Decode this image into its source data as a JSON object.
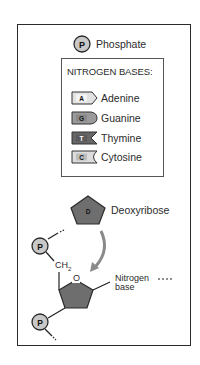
{
  "legend": {
    "phosphate": {
      "symbol": "P",
      "label": "Phosphate"
    },
    "nitrogen_bases_title": "NITROGEN BASES:",
    "bases": [
      {
        "symbol": "A",
        "label": "Adenine",
        "fill": "#e2e2e2"
      },
      {
        "symbol": "G",
        "label": "Guanine",
        "fill": "#9a9a9a"
      },
      {
        "symbol": "T",
        "label": "Thymine",
        "fill": "#666666"
      },
      {
        "symbol": "C",
        "label": "Cytosine",
        "fill": "#dcdcdc"
      }
    ],
    "deoxyribose": {
      "symbol": "D",
      "label": "Deoxyribose"
    }
  },
  "structure": {
    "phosphate_top": "P",
    "phosphate_bottom": "P",
    "ch2_label": "CH",
    "ch2_subscript": "2",
    "oxygen_label": "O",
    "nitrogen_label_line1": "Nitrogen",
    "nitrogen_label_line2": "base"
  },
  "colors": {
    "phosphate_fill": "#c8c8c8",
    "sugar_fill": "#6e6e6e",
    "outline": "#2a2a2a",
    "arrow": "#8a8a8a"
  }
}
